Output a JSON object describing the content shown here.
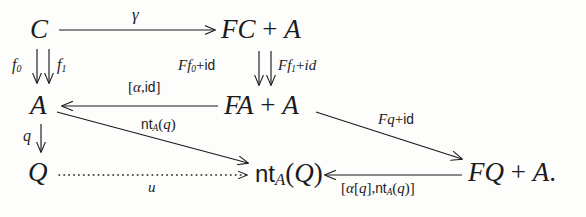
{
  "figure": {
    "kind": "commutative-diagram",
    "background_color": "#fdfdfc",
    "ink_color": "#1b1b1b"
  },
  "nodes": [
    {
      "id": "C",
      "label": "C",
      "x": 30,
      "y": 16
    },
    {
      "id": "FCA",
      "label": "FC + A",
      "x": 221,
      "y": 16
    },
    {
      "id": "A",
      "label": "A",
      "x": 30,
      "y": 93
    },
    {
      "id": "FAA",
      "label": "FA + A",
      "x": 224,
      "y": 93
    },
    {
      "id": "Q",
      "label": "Q",
      "x": 28,
      "y": 160
    },
    {
      "id": "ntAQ",
      "label": "nt_A(Q)",
      "x": 254,
      "y": 160
    },
    {
      "id": "FQA",
      "label": "FQ + A.",
      "x": 468,
      "y": 160
    }
  ],
  "edges": [
    {
      "id": "c-to-fca",
      "from": "C",
      "to": "FCA",
      "label": "γ",
      "style": "solid",
      "direction": "right"
    },
    {
      "id": "c-to-a-f0",
      "from": "C",
      "to": "A",
      "label": "f_0",
      "style": "solid",
      "direction": "down"
    },
    {
      "id": "c-to-a-f1",
      "from": "C",
      "to": "A",
      "label": "f_1",
      "style": "solid",
      "direction": "down"
    },
    {
      "id": "fca-to-faa-Ff0",
      "from": "FCA",
      "to": "FAA",
      "label": "Ff_0+id",
      "style": "solid",
      "direction": "down"
    },
    {
      "id": "fca-to-faa-Ff1",
      "from": "FCA",
      "to": "FAA",
      "label": "Ff_1+id",
      "style": "solid",
      "direction": "down"
    },
    {
      "id": "faa-to-a",
      "from": "FAA",
      "to": "A",
      "label": "[α,id]",
      "style": "solid",
      "direction": "left"
    },
    {
      "id": "a-to-q",
      "from": "A",
      "to": "Q",
      "label": "q",
      "style": "solid",
      "direction": "down"
    },
    {
      "id": "a-to-ntaq",
      "from": "A",
      "to": "ntAQ",
      "label": "nt_A(q)",
      "style": "solid",
      "direction": "diagonal-down-right"
    },
    {
      "id": "faa-to-fqa",
      "from": "FAA",
      "to": "FQA",
      "label": "Fq+id",
      "style": "solid",
      "direction": "diagonal-down-right"
    },
    {
      "id": "q-to-ntaq",
      "from": "Q",
      "to": "ntAQ",
      "label": "u",
      "style": "dotted",
      "direction": "right"
    },
    {
      "id": "fqa-to-ntaq",
      "from": "FQA",
      "to": "ntAQ",
      "label": "[α[q],nt_A(q)]",
      "style": "solid",
      "direction": "left"
    }
  ],
  "labels": {
    "gamma": "γ",
    "f0": "f",
    "f0_sub": "0",
    "f1": "f",
    "f1_sub": "1",
    "Ff0_head": "Ff",
    "Ff0_sub": "0",
    "Ff0_tail": "+",
    "Ff0_id": "id",
    "Ff1_head": "Ff",
    "Ff1_sub": "1",
    "Ff1_tail": "+",
    "Ff1_id": "id",
    "alpha_id_open": "[",
    "alpha_id_alpha": "α",
    "alpha_id_comma": ",",
    "alpha_id_id": "id",
    "alpha_id_close": "]",
    "q": "q",
    "nt": "nt",
    "nt_sub_A": "A",
    "nt_open": "(",
    "nt_arg_q": "q",
    "nt_close": ")",
    "Fq": "Fq",
    "Fq_plus": "+",
    "Fq_id": "id",
    "u": "u",
    "bot_open": "[",
    "bot_alpha": "α",
    "bot_sq_open": "[",
    "bot_q1": "q",
    "bot_sq_close": "]",
    "bot_comma": ",",
    "bot_nt": "nt",
    "bot_nt_sub": "A",
    "bot_paren_open": "(",
    "bot_q2": "q",
    "bot_paren_close": ")",
    "bot_close": "]"
  },
  "node_text": {
    "C": "C",
    "FC_F": "F",
    "FC_C": "C",
    "FC_plus": "+",
    "FC_A": "A",
    "A": "A",
    "FA_F": "F",
    "FA_A": "A",
    "FA_plus": "+",
    "FA_A2": "A",
    "Q": "Q",
    "ntAQ_nt": "nt",
    "ntAQ_sub": "A",
    "ntAQ_open": "(",
    "ntAQ_Q": "Q",
    "ntAQ_close": ")",
    "FQ_F": "F",
    "FQ_Q": "Q",
    "FQ_plus": "+",
    "FQ_A": "A",
    "FQ_period": "."
  }
}
